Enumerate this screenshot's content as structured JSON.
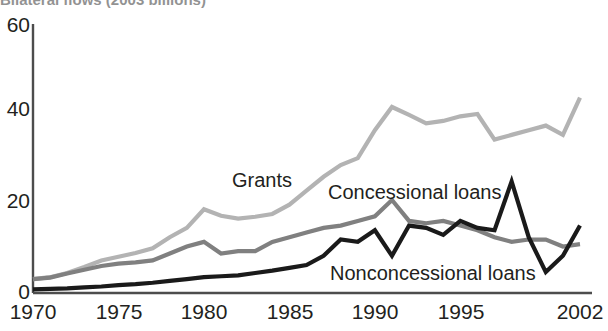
{
  "chart_data": {
    "type": "line",
    "title": "Bilateral flows (2003 billions)",
    "xlabel": "",
    "ylabel": "",
    "ylim": [
      0,
      60
    ],
    "xlim": [
      1970,
      2002
    ],
    "yticks": [
      "0",
      "20",
      "40",
      "60"
    ],
    "ytick_values": [
      0,
      20,
      40,
      60
    ],
    "xticks": [
      "1970",
      "1975",
      "1980",
      "1985",
      "1990",
      "1995",
      "2002"
    ],
    "xtick_values": [
      1970,
      1975,
      1980,
      1985,
      1990,
      1995,
      2002
    ],
    "grid": false,
    "legend_position": "inline-annotations",
    "x": [
      1970,
      1971,
      1972,
      1973,
      1974,
      1975,
      1976,
      1977,
      1978,
      1979,
      1980,
      1981,
      1982,
      1983,
      1984,
      1985,
      1986,
      1987,
      1988,
      1989,
      1990,
      1991,
      1992,
      1993,
      1994,
      1995,
      1996,
      1997,
      1998,
      1999,
      2000,
      2001,
      2002
    ],
    "series": [
      {
        "name": "Grants",
        "color": "#b3b3b3",
        "values": [
          3.0,
          3.4,
          4.3,
          5.6,
          7.0,
          7.8,
          8.6,
          9.6,
          12.0,
          14.0,
          18.0,
          16.6,
          16.0,
          16.4,
          17.0,
          19.0,
          22.0,
          25.0,
          27.5,
          29.0,
          35.0,
          40.0,
          38.3,
          36.5,
          37.0,
          38.0,
          38.5,
          33.0,
          34.0,
          35.0,
          36.0,
          34.0,
          42.0
        ]
      },
      {
        "name": "Concessional loans",
        "color": "#808080",
        "values": [
          3.0,
          3.3,
          4.2,
          5.0,
          5.8,
          6.3,
          6.6,
          7.0,
          8.5,
          10.0,
          11.0,
          8.5,
          9.0,
          9.0,
          11.0,
          12.0,
          13.0,
          14.0,
          14.5,
          15.5,
          16.5,
          20.0,
          15.5,
          15.0,
          15.5,
          14.5,
          13.5,
          12.0,
          11.0,
          11.5,
          11.5,
          10.0,
          10.5
        ]
      },
      {
        "name": "Nonconcessional loans",
        "color": "#1a1a1a",
        "values": [
          0.8,
          0.9,
          1.0,
          1.2,
          1.4,
          1.7,
          1.9,
          2.2,
          2.6,
          3.0,
          3.4,
          3.6,
          3.8,
          4.3,
          4.8,
          5.4,
          6.0,
          8.0,
          11.5,
          11.0,
          13.5,
          8.0,
          14.5,
          14.0,
          12.5,
          15.5,
          14.0,
          13.5,
          24.0,
          12.0,
          4.5,
          8.0,
          14.5
        ]
      }
    ],
    "annotations": [
      {
        "text": "Grants",
        "x": 232,
        "y": 170
      },
      {
        "text": "Concessional loans",
        "x": 328,
        "y": 182
      },
      {
        "text": "Nonconcessional loans",
        "x": 330,
        "y": 263
      }
    ]
  },
  "axis": {
    "y_ticks": [
      {
        "label": "60",
        "y": 14
      },
      {
        "label": "40",
        "y": 98
      },
      {
        "label": "20",
        "y": 190
      },
      {
        "label": "0",
        "y": 281
      }
    ],
    "x_ticks": [
      {
        "label": "1970",
        "x": 33
      },
      {
        "label": "1975",
        "x": 119
      },
      {
        "label": "1980",
        "x": 204
      },
      {
        "label": "1985",
        "x": 290
      },
      {
        "label": "1990",
        "x": 375
      },
      {
        "label": "1995",
        "x": 461
      },
      {
        "label": "2002",
        "x": 580
      }
    ]
  },
  "colors": {
    "grants": "#b3b3b3",
    "concessional": "#808080",
    "nonconcessional": "#1a1a1a",
    "axis": "#4d4d4d",
    "text": "#231f20",
    "background": "#ffffff"
  }
}
